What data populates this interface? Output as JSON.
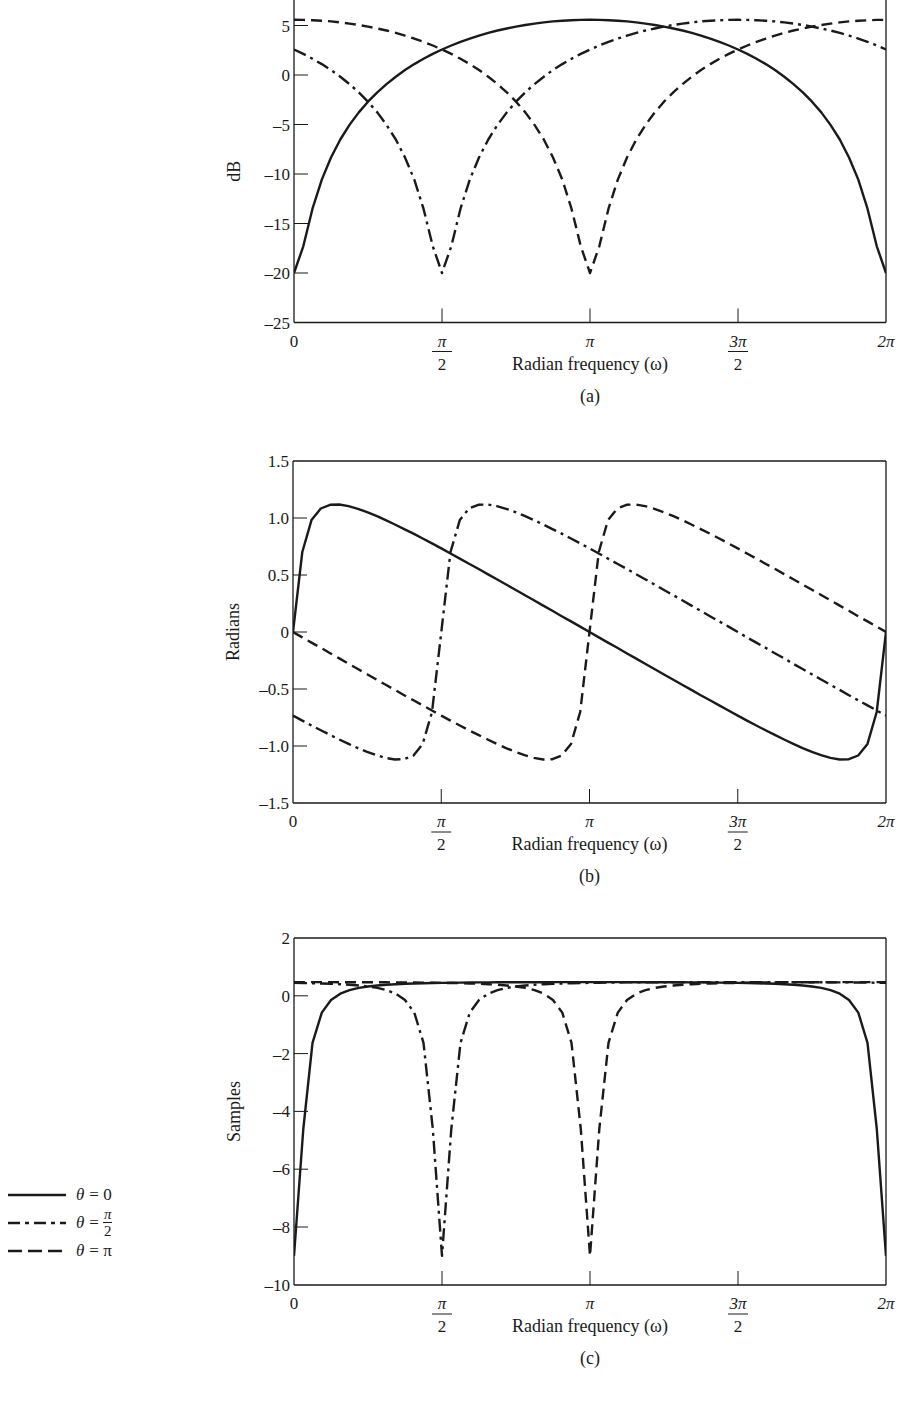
{
  "figure": {
    "panels": [
      {
        "id": "a",
        "caption": "(a)",
        "ylabel": "dB",
        "xlabel": "Radian frequency (ω)"
      },
      {
        "id": "b",
        "caption": "(b)",
        "ylabel": "Radians",
        "xlabel": "Radian frequency (ω)"
      },
      {
        "id": "c",
        "caption": "(c)",
        "ylabel": "Samples",
        "xlabel": "Radian frequency (ω)"
      }
    ],
    "x_ticks": [
      {
        "value": 0,
        "num": "0",
        "den": ""
      },
      {
        "value": 1.5707963,
        "num": "π",
        "den": "2"
      },
      {
        "value": 3.1415927,
        "num": "π",
        "den": ""
      },
      {
        "value": 4.712389,
        "num": "3π",
        "den": "2"
      },
      {
        "value": 6.2831853,
        "num": "2π",
        "den": ""
      }
    ],
    "legend": [
      {
        "name": "θ = 0",
        "theta": "θ",
        "eq": "= 0",
        "num": "",
        "den": "",
        "style": "solid"
      },
      {
        "name": "θ = π/2",
        "theta": "θ",
        "eq": "=",
        "num": "π",
        "den": "2",
        "style": "dashdot"
      },
      {
        "name": "θ = π",
        "theta": "θ",
        "eq": "= π",
        "num": "",
        "den": "",
        "style": "dashed"
      }
    ]
  },
  "chart_data": [
    {
      "type": "line",
      "title": "(a)",
      "xlabel": "Radian frequency (ω)",
      "ylabel": "dB",
      "xlim": [
        0,
        6.2831853
      ],
      "ylim": [
        -25,
        7.6
      ],
      "yticks": [
        -25,
        -20,
        -15,
        -10,
        -5,
        0,
        5
      ],
      "grid": false,
      "legend_position": "left-bottom (shared)",
      "x_step": "π/32",
      "x_count": 65,
      "series": [
        {
          "name": "θ = 0",
          "style": "solid",
          "values": [
            -20.0,
            -17.3,
            -13.51,
            -10.57,
            -8.33,
            -6.52,
            -5.04,
            -3.78,
            -2.7,
            -1.75,
            -0.92,
            -0.17,
            0.5,
            1.1,
            1.64,
            2.13,
            2.58,
            2.98,
            3.35,
            3.68,
            3.98,
            4.25,
            4.49,
            4.7,
            4.89,
            5.05,
            5.19,
            5.31,
            5.41,
            5.48,
            5.53,
            5.57,
            5.58,
            5.57,
            5.53,
            5.48,
            5.41,
            5.31,
            5.19,
            5.05,
            4.89,
            4.7,
            4.49,
            4.25,
            3.98,
            3.68,
            3.35,
            2.98,
            2.58,
            2.13,
            1.64,
            1.1,
            0.5,
            -0.17,
            -0.92,
            -1.75,
            -2.7,
            -3.78,
            -5.04,
            -6.52,
            -8.33,
            -10.57,
            -13.51,
            -17.3,
            -20.0
          ]
        },
        {
          "name": "θ = π/2",
          "style": "dashdot",
          "values": [
            2.58,
            2.13,
            1.64,
            1.1,
            0.5,
            -0.17,
            -0.92,
            -1.75,
            -2.7,
            -3.78,
            -5.04,
            -6.52,
            -8.33,
            -10.57,
            -13.51,
            -17.3,
            -20.0,
            -17.3,
            -13.51,
            -10.57,
            -8.33,
            -6.52,
            -5.04,
            -3.78,
            -2.7,
            -1.75,
            -0.92,
            -0.17,
            0.5,
            1.1,
            1.64,
            2.13,
            2.58,
            2.98,
            3.35,
            3.68,
            3.98,
            4.25,
            4.49,
            4.7,
            4.89,
            5.05,
            5.19,
            5.31,
            5.41,
            5.48,
            5.53,
            5.57,
            5.58,
            5.57,
            5.53,
            5.48,
            5.41,
            5.31,
            5.19,
            5.05,
            4.89,
            4.7,
            4.49,
            4.25,
            3.98,
            3.68,
            3.35,
            2.98,
            2.58
          ]
        },
        {
          "name": "θ = π",
          "style": "dashed",
          "values": [
            5.58,
            5.57,
            5.53,
            5.48,
            5.41,
            5.31,
            5.19,
            5.05,
            4.89,
            4.7,
            4.49,
            4.25,
            3.98,
            3.68,
            3.35,
            2.98,
            2.58,
            2.13,
            1.64,
            1.1,
            0.5,
            -0.17,
            -0.92,
            -1.75,
            -2.7,
            -3.78,
            -5.04,
            -6.52,
            -8.33,
            -10.57,
            -13.51,
            -17.3,
            -20.0,
            -17.3,
            -13.51,
            -10.57,
            -8.33,
            -6.52,
            -5.04,
            -3.78,
            -2.7,
            -1.75,
            -0.92,
            -0.17,
            0.5,
            1.1,
            1.64,
            2.13,
            2.58,
            2.98,
            3.35,
            3.68,
            3.98,
            4.25,
            4.49,
            4.7,
            4.89,
            5.05,
            5.19,
            5.31,
            5.41,
            5.48,
            5.53,
            5.57,
            5.58
          ]
        }
      ]
    },
    {
      "type": "line",
      "title": "(b)",
      "xlabel": "Radian frequency (ω)",
      "ylabel": "Radians",
      "xlim": [
        0,
        6.2831853
      ],
      "ylim": [
        -1.5,
        1.5
      ],
      "yticks": [
        -1.5,
        -1.0,
        -0.5,
        0,
        0.5,
        1.0,
        1.5
      ],
      "ytick_labels": [
        "-1.5",
        "-1.0",
        "-0.5",
        "0",
        "0.5",
        "1.0",
        "1.5"
      ],
      "grid": false,
      "x_step": "π/32",
      "x_count": 65,
      "series": [
        {
          "name": "θ = 0",
          "style": "solid",
          "values": [
            0,
            0.702,
            0.982,
            1.083,
            1.116,
            1.118,
            1.104,
            1.081,
            1.052,
            1.018,
            0.982,
            0.943,
            0.903,
            0.862,
            0.82,
            0.777,
            0.733,
            0.689,
            0.644,
            0.599,
            0.554,
            0.508,
            0.463,
            0.417,
            0.371,
            0.325,
            0.279,
            0.232,
            0.186,
            0.139,
            0.093,
            0.047,
            0,
            -0.047,
            -0.093,
            -0.139,
            -0.186,
            -0.232,
            -0.279,
            -0.325,
            -0.371,
            -0.417,
            -0.463,
            -0.508,
            -0.554,
            -0.599,
            -0.644,
            -0.689,
            -0.733,
            -0.777,
            -0.82,
            -0.862,
            -0.903,
            -0.943,
            -0.982,
            -1.018,
            -1.052,
            -1.081,
            -1.104,
            -1.118,
            -1.116,
            -1.083,
            -0.982,
            -0.702,
            0
          ]
        },
        {
          "name": "θ = π/2",
          "style": "dashdot",
          "values": [
            -0.733,
            -0.777,
            -0.82,
            -0.862,
            -0.903,
            -0.943,
            -0.982,
            -1.018,
            -1.052,
            -1.081,
            -1.104,
            -1.118,
            -1.116,
            -1.083,
            -0.982,
            -0.702,
            0,
            0.702,
            0.982,
            1.083,
            1.116,
            1.118,
            1.104,
            1.081,
            1.052,
            1.018,
            0.982,
            0.943,
            0.903,
            0.862,
            0.82,
            0.777,
            0.733,
            0.689,
            0.644,
            0.599,
            0.554,
            0.508,
            0.463,
            0.417,
            0.371,
            0.325,
            0.279,
            0.232,
            0.186,
            0.139,
            0.093,
            0.047,
            0,
            -0.047,
            -0.093,
            -0.139,
            -0.186,
            -0.232,
            -0.279,
            -0.325,
            -0.371,
            -0.417,
            -0.463,
            -0.508,
            -0.554,
            -0.599,
            -0.644,
            -0.689,
            -0.733
          ]
        },
        {
          "name": "θ = π",
          "style": "dashed",
          "values": [
            0,
            -0.047,
            -0.093,
            -0.139,
            -0.186,
            -0.232,
            -0.279,
            -0.325,
            -0.371,
            -0.417,
            -0.463,
            -0.508,
            -0.554,
            -0.599,
            -0.644,
            -0.689,
            -0.733,
            -0.777,
            -0.82,
            -0.862,
            -0.903,
            -0.943,
            -0.982,
            -1.018,
            -1.052,
            -1.081,
            -1.104,
            -1.118,
            -1.116,
            -1.083,
            -0.982,
            -0.702,
            0,
            0.702,
            0.982,
            1.083,
            1.116,
            1.118,
            1.104,
            1.081,
            1.052,
            1.018,
            0.982,
            0.943,
            0.903,
            0.862,
            0.82,
            0.777,
            0.733,
            0.689,
            0.644,
            0.599,
            0.554,
            0.508,
            0.463,
            0.417,
            0.371,
            0.325,
            0.279,
            0.232,
            0.186,
            0.139,
            0.093,
            0.047,
            0
          ]
        }
      ]
    },
    {
      "type": "line",
      "title": "(c)",
      "xlabel": "Radian frequency (ω)",
      "ylabel": "Samples",
      "xlim": [
        0,
        6.2831853
      ],
      "ylim": [
        -10,
        2
      ],
      "yticks": [
        -10,
        -8,
        -6,
        -4,
        -2,
        0,
        2
      ],
      "grid": false,
      "x_step": "π/32",
      "x_count": 65,
      "series": [
        {
          "name": "θ = 0",
          "style": "solid",
          "values": [
            -9.0,
            -4.61,
            -1.63,
            -0.58,
            -0.146,
            0.073,
            0.197,
            0.273,
            0.323,
            0.358,
            0.383,
            0.401,
            0.415,
            0.426,
            0.435,
            0.442,
            0.448,
            0.452,
            0.456,
            0.459,
            0.462,
            0.464,
            0.466,
            0.468,
            0.469,
            0.47,
            0.471,
            0.472,
            0.473,
            0.473,
            0.473,
            0.474,
            0.474,
            0.474,
            0.473,
            0.473,
            0.473,
            0.472,
            0.471,
            0.47,
            0.469,
            0.468,
            0.466,
            0.464,
            0.462,
            0.459,
            0.456,
            0.452,
            0.448,
            0.442,
            0.435,
            0.426,
            0.415,
            0.401,
            0.383,
            0.358,
            0.323,
            0.273,
            0.197,
            0.073,
            -0.146,
            -0.58,
            -1.63,
            -4.61,
            -9.0
          ]
        },
        {
          "name": "θ = π/2",
          "style": "dashdot",
          "values": [
            0.448,
            0.442,
            0.435,
            0.426,
            0.415,
            0.401,
            0.383,
            0.358,
            0.323,
            0.273,
            0.197,
            0.073,
            -0.146,
            -0.58,
            -1.63,
            -4.61,
            -9.0,
            -4.61,
            -1.63,
            -0.58,
            -0.146,
            0.073,
            0.197,
            0.273,
            0.323,
            0.358,
            0.383,
            0.401,
            0.415,
            0.426,
            0.435,
            0.442,
            0.448,
            0.452,
            0.456,
            0.459,
            0.462,
            0.464,
            0.466,
            0.468,
            0.469,
            0.47,
            0.471,
            0.472,
            0.473,
            0.473,
            0.473,
            0.474,
            0.474,
            0.474,
            0.473,
            0.473,
            0.473,
            0.472,
            0.471,
            0.47,
            0.469,
            0.468,
            0.466,
            0.464,
            0.462,
            0.459,
            0.456,
            0.452,
            0.448
          ]
        },
        {
          "name": "θ = π",
          "style": "dashed",
          "values": [
            0.474,
            0.474,
            0.473,
            0.473,
            0.473,
            0.472,
            0.471,
            0.47,
            0.469,
            0.468,
            0.466,
            0.464,
            0.462,
            0.459,
            0.456,
            0.452,
            0.448,
            0.442,
            0.435,
            0.426,
            0.415,
            0.401,
            0.383,
            0.358,
            0.323,
            0.273,
            0.197,
            0.073,
            -0.146,
            -0.58,
            -1.63,
            -4.61,
            -9.0,
            -4.61,
            -1.63,
            -0.58,
            -0.146,
            0.073,
            0.197,
            0.273,
            0.323,
            0.358,
            0.383,
            0.401,
            0.415,
            0.426,
            0.435,
            0.442,
            0.448,
            0.452,
            0.456,
            0.459,
            0.462,
            0.464,
            0.466,
            0.468,
            0.469,
            0.47,
            0.471,
            0.472,
            0.473,
            0.473,
            0.473,
            0.474,
            0.474
          ]
        }
      ]
    }
  ],
  "layout": {
    "panels": [
      {
        "x0": 294,
        "x1": 886,
        "ytop_px": 0,
        "ybottom_px": 322.5,
        "y_zero_px": 75,
        "px_per_unit": 9.9,
        "top_border": false
      },
      {
        "x0": 293,
        "x1": 886,
        "ytop_px": 461,
        "ybottom_px": 803,
        "y_zero_px": 632,
        "px_per_unit": 114,
        "top_border": true
      },
      {
        "x0": 294,
        "x1": 886,
        "ytop_px": 938,
        "ybottom_px": 1285,
        "y_zero_px": 995.8,
        "px_per_unit": 28.9,
        "top_border": true
      }
    ],
    "line_color": "#1a1a1a",
    "background": "#ffffff"
  }
}
